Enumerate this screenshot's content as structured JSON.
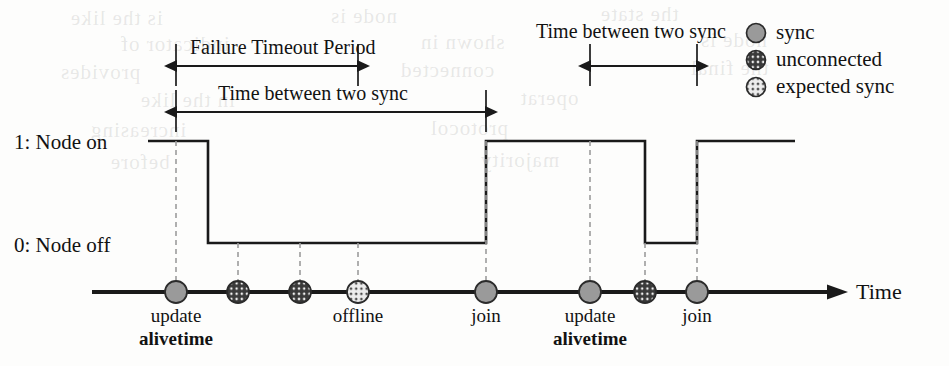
{
  "figure": {
    "axis": {
      "high_label": "1: Node on",
      "low_label": "0: Node off",
      "time_label": "Time"
    },
    "spans": [
      {
        "id": "failure-timeout",
        "label": "Failure Timeout Period",
        "x1": 176,
        "x2": 358,
        "y": 66
      },
      {
        "id": "time-between-sync-left",
        "label": "Time between two sync",
        "x1": 176,
        "x2": 486,
        "y": 112
      },
      {
        "id": "time-between-sync-right",
        "label": "Time between two sync",
        "x1": 590,
        "x2": 697,
        "y": 66
      }
    ],
    "events": [
      {
        "id": "e1",
        "x": 176,
        "type": "sync",
        "label": "update",
        "label2": "alivetime"
      },
      {
        "id": "e2",
        "x": 238,
        "type": "unconnected",
        "label": "",
        "label2": ""
      },
      {
        "id": "e3",
        "x": 300,
        "type": "unconnected",
        "label": "",
        "label2": ""
      },
      {
        "id": "e4",
        "x": 358,
        "type": "expected-sync",
        "label": "offline",
        "label2": ""
      },
      {
        "id": "e5",
        "x": 486,
        "type": "sync",
        "label": "join",
        "label2": ""
      },
      {
        "id": "e6",
        "x": 590,
        "type": "sync",
        "label": "update",
        "label2": "alivetime"
      },
      {
        "id": "e7",
        "x": 645,
        "type": "unconnected",
        "label": "",
        "label2": ""
      },
      {
        "id": "e8",
        "x": 697,
        "type": "sync",
        "label": "join",
        "label2": ""
      }
    ],
    "legend": [
      {
        "id": "sync",
        "label": "sync",
        "marker": "sync-marker"
      },
      {
        "id": "unconnected",
        "label": "unconnected",
        "marker": "unconnected-marker"
      },
      {
        "id": "expected-sync",
        "label": "expected sync",
        "marker": "expected-sync-marker"
      }
    ],
    "bleed_text": [
      {
        "t": "is the like",
        "x": 70,
        "y": 6
      },
      {
        "t": "node is",
        "x": 330,
        "y": 4
      },
      {
        "t": "the state",
        "x": 600,
        "y": 2
      },
      {
        "t": "indicator of",
        "x": 120,
        "y": 32
      },
      {
        "t": "shown in",
        "x": 420,
        "y": 30
      },
      {
        "t": "node is",
        "x": 700,
        "y": 28
      },
      {
        "t": "provides",
        "x": 60,
        "y": 60
      },
      {
        "t": "connected",
        "x": 400,
        "y": 58
      },
      {
        "t": "the final",
        "x": 690,
        "y": 56
      },
      {
        "t": "in the like",
        "x": 140,
        "y": 88
      },
      {
        "t": "operat",
        "x": 520,
        "y": 86
      },
      {
        "t": "increasing",
        "x": 90,
        "y": 118
      },
      {
        "t": "protocol",
        "x": 430,
        "y": 116
      },
      {
        "t": "before",
        "x": 110,
        "y": 150
      },
      {
        "t": "majority",
        "x": 480,
        "y": 148
      }
    ],
    "colors": {
      "stroke": "#1a1a1a",
      "sync_fill": "#9a9a9a",
      "unconnected_fill": "#3a3a3a",
      "expected_fill": "#e3e3e3",
      "dash": "#9c9c9c"
    }
  },
  "chart_data": {
    "type": "line",
    "xlabel": "Time",
    "ylabel": "Node state",
    "ylim": [
      0,
      1
    ],
    "ytick_labels": [
      "0: Node off",
      "1: Node on"
    ],
    "grid": false,
    "legend_position": "top-right",
    "series": [
      {
        "name": "Node state",
        "step": "post",
        "x": [
          0,
          208,
          486,
          645,
          697,
          795
        ],
        "values": [
          1,
          0,
          1,
          0,
          1,
          1
        ]
      }
    ],
    "events": [
      {
        "x": 176,
        "type": "sync",
        "label": "update alivetime"
      },
      {
        "x": 238,
        "type": "unconnected",
        "label": ""
      },
      {
        "x": 300,
        "type": "unconnected",
        "label": ""
      },
      {
        "x": 358,
        "type": "expected-sync",
        "label": "offline"
      },
      {
        "x": 486,
        "type": "sync",
        "label": "join"
      },
      {
        "x": 590,
        "type": "sync",
        "label": "update alivetime"
      },
      {
        "x": 645,
        "type": "unconnected",
        "label": ""
      },
      {
        "x": 697,
        "type": "sync",
        "label": "join"
      }
    ],
    "annotations": [
      {
        "text": "Failure Timeout Period",
        "from": 176,
        "to": 358
      },
      {
        "text": "Time between two sync",
        "from": 176,
        "to": 486
      },
      {
        "text": "Time between two sync",
        "from": 590,
        "to": 697
      }
    ]
  }
}
